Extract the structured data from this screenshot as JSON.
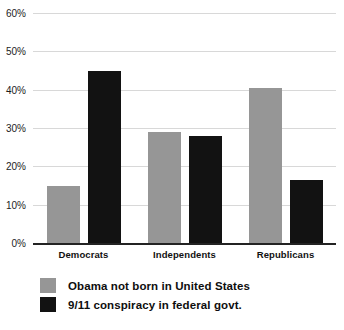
{
  "chart_data": {
    "type": "bar",
    "title": "",
    "subtitle": "",
    "xlabel": "",
    "ylabel": "",
    "categories": [
      "Democrats",
      "Independents",
      "Republicans"
    ],
    "series": [
      {
        "name": "Obama not born in United States",
        "color": "#969696",
        "values": [
          15,
          29,
          40.5
        ]
      },
      {
        "name": "9/11 conspiracy in federal govt.",
        "color": "#121212",
        "values": [
          45,
          28,
          16.5
        ]
      }
    ],
    "ylim": [
      0,
      60
    ],
    "ytick_values": [
      0,
      10,
      20,
      30,
      40,
      50,
      60
    ],
    "ytick_labels": [
      "0%",
      "10%",
      "20%",
      "30%",
      "40%",
      "50%",
      "60%"
    ],
    "grid": true,
    "grid_color": "#d8d8d8",
    "axis_color": "#232323",
    "legend_position": "bottom-left",
    "value_suffix": "%"
  }
}
